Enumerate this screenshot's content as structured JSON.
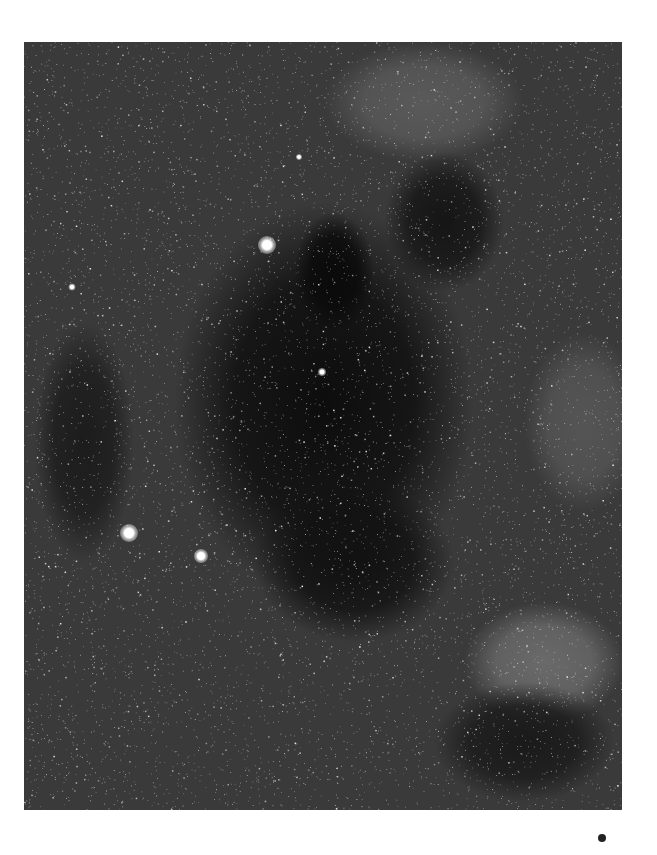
{
  "image": {
    "subject": "star field with dark nebula",
    "background_color": "#ffffff",
    "frame": {
      "x": 24,
      "y": 42,
      "width": 598,
      "height": 768
    },
    "base_tone": "#3a3a3a",
    "dark_regions": [
      {
        "cx": 300,
        "cy": 360,
        "rx": 150,
        "ry": 200,
        "color": "#0d0d0d"
      },
      {
        "cx": 310,
        "cy": 230,
        "rx": 40,
        "ry": 60,
        "color": "#0a0a0a"
      },
      {
        "cx": 420,
        "cy": 180,
        "rx": 60,
        "ry": 70,
        "color": "#151515"
      },
      {
        "cx": 330,
        "cy": 520,
        "rx": 100,
        "ry": 80,
        "color": "#111111"
      },
      {
        "cx": 500,
        "cy": 700,
        "rx": 90,
        "ry": 60,
        "color": "#1a1a1a"
      },
      {
        "cx": 60,
        "cy": 400,
        "rx": 50,
        "ry": 120,
        "color": "#1c1c1c"
      }
    ],
    "light_regions": [
      {
        "cx": 520,
        "cy": 620,
        "rx": 80,
        "ry": 60,
        "color": "#6a6a6a"
      },
      {
        "cx": 400,
        "cy": 60,
        "rx": 100,
        "ry": 60,
        "color": "#5a5a5a"
      },
      {
        "cx": 560,
        "cy": 380,
        "rx": 60,
        "ry": 90,
        "color": "#555555"
      }
    ],
    "bright_stars": [
      {
        "x": 243,
        "y": 203,
        "size": 18
      },
      {
        "x": 105,
        "y": 491,
        "size": 18
      },
      {
        "x": 177,
        "y": 514,
        "size": 14
      },
      {
        "x": 298,
        "y": 330,
        "size": 8
      },
      {
        "x": 48,
        "y": 245,
        "size": 7
      },
      {
        "x": 275,
        "y": 115,
        "size": 6
      }
    ],
    "star_count": 9000,
    "seed": 42
  },
  "marker_dot": {
    "x": 602,
    "y": 838,
    "color": "#222222"
  }
}
